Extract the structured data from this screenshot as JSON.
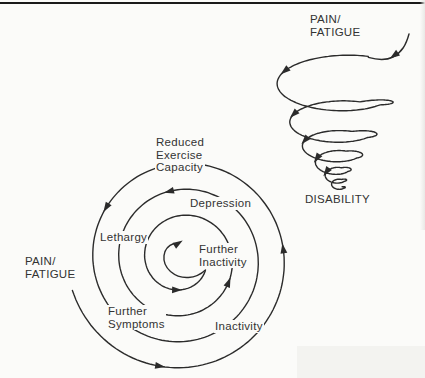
{
  "colors": {
    "stroke": "#2b2b2b",
    "text": "#333333",
    "background": "#fbfbf9",
    "rule": "#1a1a1a"
  },
  "main_spiral": {
    "description": "vicious-circle spiral, winds inward counterclockwise",
    "labels": [
      {
        "id": "reduced-exercise-capacity",
        "text": "Reduced\nExercise\nCapacity"
      },
      {
        "id": "depression",
        "text": "Depression"
      },
      {
        "id": "lethargy",
        "text": "Lethargy"
      },
      {
        "id": "further-inactivity",
        "text": "Further\nInactivity"
      },
      {
        "id": "pain-fatigue",
        "text": "PAIN/\nFATIGUE"
      },
      {
        "id": "further-symptoms",
        "text": "Further\nSymptoms"
      },
      {
        "id": "inactivity",
        "text": "Inactivity"
      }
    ]
  },
  "tornado_spiral": {
    "description": "descending funnel spiral",
    "top_label": "PAIN/\nFATIGUE",
    "bottom_label": "DISABILITY"
  }
}
